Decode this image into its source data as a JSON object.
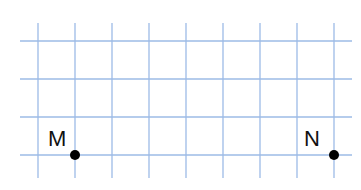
{
  "grid": {
    "color": "#9dbbe6",
    "vertical_x": [
      38,
      75,
      112,
      149,
      186,
      223,
      260,
      297,
      334
    ],
    "horizontal_y": [
      41,
      79,
      117,
      155
    ],
    "v_top": 23,
    "v_bottom": 178,
    "h_left": 20,
    "h_right": 352
  },
  "points": [
    {
      "name": "M",
      "x": 75,
      "y": 155,
      "label_x": 48,
      "label_y": 146
    },
    {
      "name": "N",
      "x": 334,
      "y": 155,
      "label_x": 304,
      "label_y": 146
    }
  ],
  "point_color": "#000000"
}
